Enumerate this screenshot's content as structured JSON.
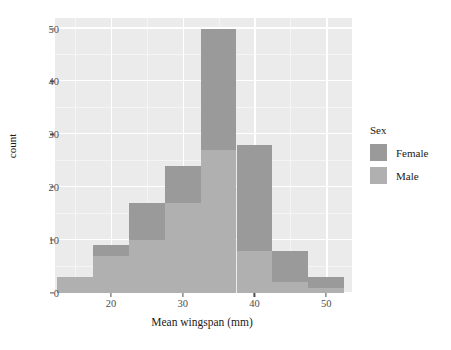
{
  "chart_data": {
    "type": "bar",
    "subtype": "histogram-overlaid",
    "title": "",
    "xlabel": "Mean wingspan (mm)",
    "ylabel": "count",
    "xlim": [
      12.2,
      53.6
    ],
    "ylim": [
      0,
      52
    ],
    "grid": true,
    "binwidth": 5,
    "bin_edges": [
      12.5,
      17.5,
      22.5,
      27.5,
      32.5,
      37.5,
      42.5,
      47.5,
      52.5
    ],
    "categories": [
      "12.5-17.5",
      "17.5-22.5",
      "22.5-27.5",
      "27.5-32.5",
      "32.5-37.5",
      "37.5-42.5",
      "42.5-47.5",
      "47.5-52.5"
    ],
    "x_ticks": [
      20,
      30,
      40,
      50
    ],
    "x_tick_labels": [
      "20",
      "30",
      "40",
      "50"
    ],
    "y_ticks": [
      0,
      10,
      20,
      30,
      40,
      50
    ],
    "y_tick_labels": [
      "0",
      "10",
      "20",
      "30",
      "40",
      "50"
    ],
    "y_minor_ticks": [
      5,
      15,
      25,
      35,
      45
    ],
    "x_minor_ticks": [
      15,
      25,
      35,
      45
    ],
    "legend_position": "right",
    "legend_title": "Sex",
    "series": [
      {
        "name": "Female",
        "color": "#9a9a9a",
        "values": [
          0,
          9,
          17,
          24,
          50,
          28,
          8,
          3
        ]
      },
      {
        "name": "Male",
        "color": "#b0b0b0",
        "values": [
          3,
          7,
          10,
          17,
          27,
          8,
          2,
          1
        ]
      }
    ],
    "panel_background": "#ebebeb",
    "gridline_color": "#ffffff",
    "text_color": "#1a1a1a",
    "axis_text_color": "#4d4d4d"
  },
  "axes": {
    "xlabel": "Mean wingspan (mm)",
    "ylabel": "count"
  },
  "legend": {
    "title": "Sex",
    "items": [
      {
        "label": "Female",
        "color": "#9a9a9a"
      },
      {
        "label": "Male",
        "color": "#b0b0b0"
      }
    ]
  }
}
